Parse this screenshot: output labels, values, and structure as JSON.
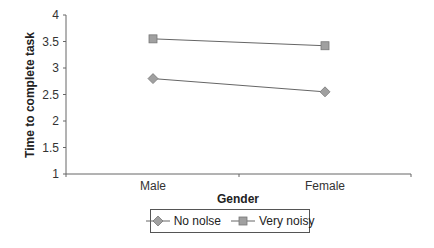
{
  "chart_data": {
    "type": "line",
    "title": "",
    "xlabel": "Gender",
    "ylabel": "Time to complete task",
    "categories": [
      "Male",
      "Female"
    ],
    "series": [
      {
        "name": "No nolse",
        "marker": "diamond",
        "values": [
          2.8,
          2.55
        ]
      },
      {
        "name": "Very noisy",
        "marker": "square",
        "values": [
          3.55,
          3.42
        ]
      }
    ],
    "ylim": [
      1,
      4
    ],
    "yticks": [
      "1",
      "1.5",
      "2",
      "2.5",
      "3",
      "3.5",
      "4"
    ],
    "grid": false,
    "legend_position": "bottom"
  },
  "colors": {
    "marker_fill": "#a0a0a0",
    "line": "#666666",
    "axis": "#666666"
  }
}
